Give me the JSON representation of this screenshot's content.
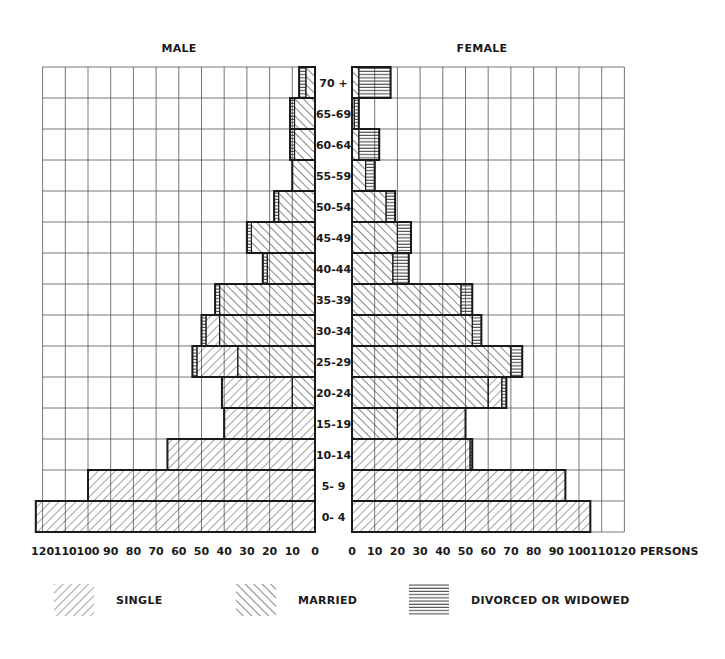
{
  "chart_data": {
    "type": "bar",
    "subtype": "population-pyramid",
    "orientation": "horizontal",
    "titles": {
      "left": "MALE",
      "right": "FEMALE"
    },
    "xlabel": "PERSONS",
    "xlim": [
      0,
      120
    ],
    "x_ticks": [
      0,
      10,
      20,
      30,
      40,
      50,
      60,
      70,
      80,
      90,
      100,
      110,
      120
    ],
    "grid": true,
    "categories": [
      "70 +",
      "65-69",
      "60-64",
      "55-59",
      "50-54",
      "45-49",
      "40-44",
      "35-39",
      "30-34",
      "25-29",
      "20-24",
      "15-19",
      "10-14",
      "5- 9",
      "0- 4"
    ],
    "stack_order_from_axis": [
      "married",
      "single",
      "divorced_or_widowed"
    ],
    "series": [
      {
        "group": "male",
        "name": "SINGLE",
        "key": "single",
        "values": [
          0,
          0,
          0,
          0,
          0,
          0,
          0,
          0,
          6,
          18,
          31,
          40,
          65,
          100,
          123
        ]
      },
      {
        "group": "male",
        "name": "MARRIED",
        "key": "married",
        "values": [
          4,
          9,
          9,
          10,
          16,
          28,
          21,
          42,
          42,
          34,
          10,
          0,
          0,
          0,
          0
        ]
      },
      {
        "group": "male",
        "name": "DIVORCED OR WIDOWED",
        "key": "divorced_or_widowed",
        "values": [
          3,
          2,
          2,
          0,
          2,
          2,
          2,
          2,
          2,
          2,
          0,
          0,
          0,
          0,
          0
        ]
      },
      {
        "group": "female",
        "name": "SINGLE",
        "key": "single",
        "values": [
          0,
          0,
          0,
          0,
          0,
          0,
          0,
          0,
          0,
          0,
          6,
          30,
          52,
          94,
          105
        ]
      },
      {
        "group": "female",
        "name": "MARRIED",
        "key": "married",
        "values": [
          3,
          1,
          3,
          6,
          15,
          20,
          18,
          48,
          53,
          70,
          60,
          20,
          0,
          0,
          0
        ]
      },
      {
        "group": "female",
        "name": "DIVORCED OR WIDOWED",
        "key": "divorced_or_widowed",
        "values": [
          14,
          2,
          9,
          4,
          4,
          6,
          7,
          5,
          4,
          5,
          2,
          0,
          1,
          0,
          0
        ]
      }
    ],
    "totals": {
      "male": [
        7,
        11,
        11,
        10,
        18,
        30,
        23,
        44,
        50,
        54,
        41,
        40,
        65,
        100,
        123
      ],
      "female": [
        17,
        3,
        12,
        10,
        19,
        26,
        25,
        53,
        57,
        75,
        68,
        50,
        53,
        94,
        105
      ]
    },
    "legend": [
      {
        "key": "single",
        "label": "SINGLE",
        "pattern": "diagonal-forward"
      },
      {
        "key": "married",
        "label": "MARRIED",
        "pattern": "diagonal-backward"
      },
      {
        "key": "divorced_or_widowed",
        "label": "DIVORCED OR WIDOWED",
        "pattern": "horizontal-lines"
      }
    ],
    "legend_position": "bottom"
  },
  "ui": {
    "title_male": "MALE",
    "title_female": "FEMALE",
    "axis_unit": "PERSONS",
    "ink_color": "#1a1a1a",
    "grid_color": "#555555"
  }
}
